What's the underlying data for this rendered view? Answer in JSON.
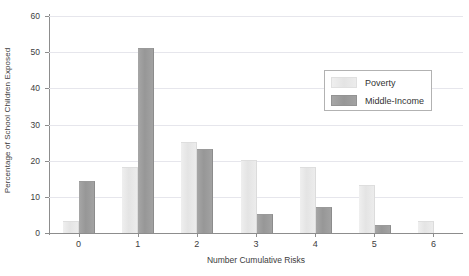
{
  "chart_data": {
    "type": "bar",
    "title": "",
    "xlabel": "Number Cumulative Risks",
    "ylabel": "Percentage of School Children Exposed",
    "categories": [
      "0",
      "1",
      "2",
      "3",
      "4",
      "5",
      "6"
    ],
    "series": [
      {
        "name": "Poverty",
        "color": "#e8e8e8",
        "values": [
          3,
          18,
          25,
          20,
          18,
          13,
          3
        ]
      },
      {
        "name": "Middle-Income",
        "color": "#9b9b9b",
        "values": [
          14,
          51,
          23,
          5,
          7,
          2,
          0
        ]
      }
    ],
    "ylim": [
      0,
      60
    ],
    "yticks": [
      0,
      10,
      20,
      30,
      40,
      50,
      60
    ],
    "ytick_labels": [
      "0",
      "10",
      "20",
      "30",
      "40",
      "50",
      "60"
    ],
    "xlim": [
      -0.5,
      6.5
    ],
    "grid": true,
    "grid_axis": "y",
    "legend_position": "upper right",
    "legend_entries": [
      "Poverty",
      "Middle-Income"
    ]
  }
}
